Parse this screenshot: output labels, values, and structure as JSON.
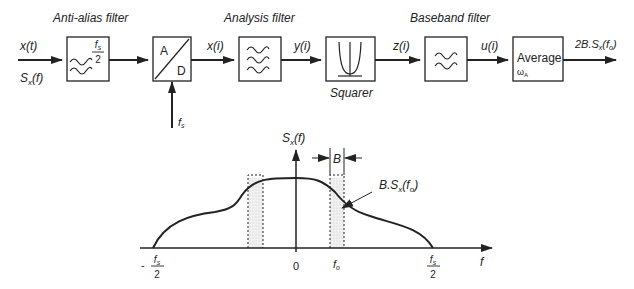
{
  "block_diagram": {
    "signals": {
      "input_time": "x(t)",
      "input_spectrum": "S",
      "input_spectrum_sub": "x",
      "input_spectrum_arg": "(f)",
      "sampled": "x(i)",
      "filtered": "y(i)",
      "squared": "z(i)",
      "baseband": "u(i)",
      "output": "2B.S",
      "output_sub": "x",
      "output_arg_open": "(f",
      "output_arg_sub": "o",
      "output_arg_close": ")"
    },
    "blocks": [
      {
        "id": "anti-alias",
        "title": "Anti-alias filter",
        "cutoff_num": "f",
        "cutoff_num_sub": "s",
        "cutoff_den": "2"
      },
      {
        "id": "adc",
        "top": "A",
        "bottom": "D",
        "clock": "f",
        "clock_sub": "s"
      },
      {
        "id": "analysis",
        "title": "Analysis filter"
      },
      {
        "id": "squarer",
        "caption": "Squarer"
      },
      {
        "id": "baseband",
        "title": "Baseband filter"
      },
      {
        "id": "average",
        "label": "Average",
        "param": "ω",
        "param_sub": "A"
      }
    ]
  },
  "spectrum_plot": {
    "y_label": "S",
    "y_label_sub": "x",
    "y_label_arg": "(f)",
    "x_label": "f",
    "x_ticks": {
      "neg_half_prefix": "-",
      "neg_half_num": "f",
      "neg_half_num_sub": "s",
      "neg_half_den": "2",
      "zero": "0",
      "f0": "f",
      "f0_sub": "o",
      "pos_half_num": "f",
      "pos_half_num_sub": "s",
      "pos_half_den": "2"
    },
    "bandwidth_label": "B",
    "annotation": "B.S",
    "annotation_sub": "x",
    "annotation_arg_open": "(f",
    "annotation_arg_sub": "o",
    "annotation_arg_close": ")"
  }
}
